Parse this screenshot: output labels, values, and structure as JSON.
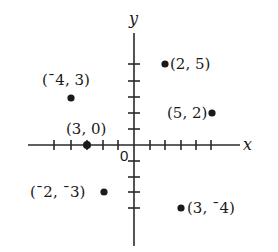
{
  "diagram": {
    "type": "coordinate-plane",
    "axes": {
      "x_label": "x",
      "y_label": "y",
      "origin_label": "0",
      "x_ticks_left": 5,
      "x_ticks_right": 5,
      "y_ticks_up": 6,
      "y_ticks_down": 4
    },
    "points": [
      {
        "id": "p1",
        "label": "(2, 5)",
        "x": 2,
        "y": 5,
        "label_side": "right"
      },
      {
        "id": "p2",
        "label": "(¯4, 3)",
        "x": -4,
        "y": 3,
        "label_side": "above"
      },
      {
        "id": "p3",
        "label": "(5, 2)",
        "x": 5,
        "y": 2,
        "label_side": "left"
      },
      {
        "id": "p4",
        "label": "(3, 0)",
        "x": -3,
        "y": 0,
        "label_side": "above"
      },
      {
        "id": "p5",
        "label": "(¯2, ¯3)",
        "x": -2,
        "y": -3,
        "label_side": "left"
      },
      {
        "id": "p6",
        "label": "(3, ¯4)",
        "x": 3,
        "y": -4,
        "label_side": "right"
      }
    ]
  },
  "colors": {
    "ink": "#1a1a1a",
    "background": "#ffffff"
  }
}
